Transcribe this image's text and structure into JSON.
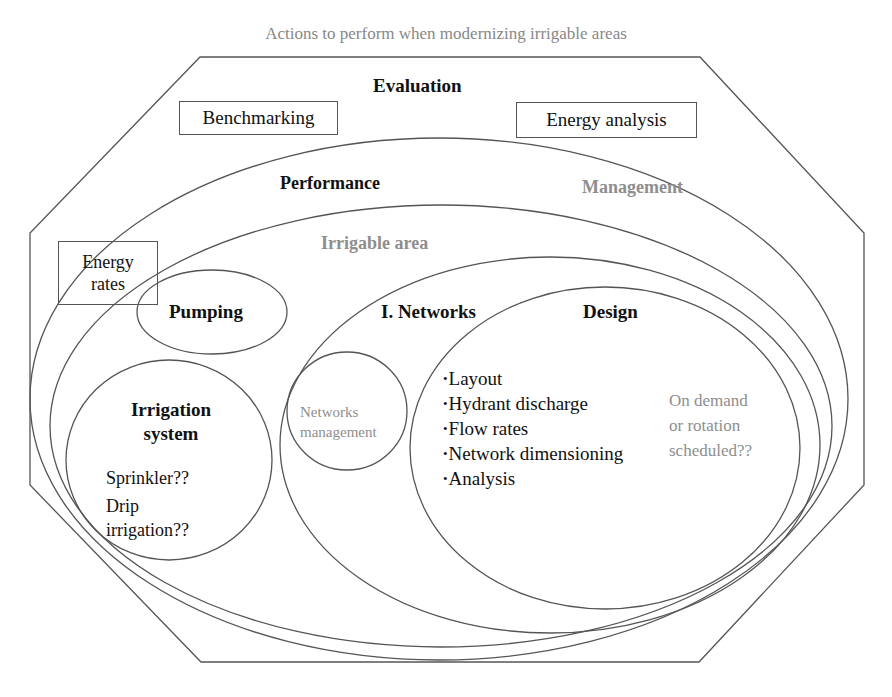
{
  "title": "Actions to perform when modernizing irrigable areas",
  "evaluation": {
    "label": "Evaluation",
    "boxes": [
      {
        "label": "Benchmarking"
      },
      {
        "label": "Energy analysis"
      }
    ]
  },
  "performance": {
    "label": "Performance"
  },
  "management": {
    "label": "Management"
  },
  "irrigable_area": {
    "label": "Irrigable area"
  },
  "energy_rates": {
    "line1": "Energy",
    "line2": "rates"
  },
  "pumping": {
    "label": "Pumping"
  },
  "irrigation_system": {
    "title_line1": "Irrigation",
    "title_line2": "system",
    "options": [
      "Sprinkler??",
      "Drip",
      "irrigation??"
    ]
  },
  "networks": {
    "label": "I. Networks"
  },
  "networks_management": {
    "line1": "Networks",
    "line2": "management"
  },
  "design": {
    "label": "Design",
    "items": [
      "Layout",
      "Hydrant discharge",
      "Flow rates",
      "Network dimensioning",
      "Analysis"
    ],
    "note": [
      "On demand",
      "or rotation",
      "scheduled??"
    ]
  },
  "colors": {
    "stroke": "#555555",
    "gray_text": "#8e8e8e",
    "text": "#111111"
  }
}
